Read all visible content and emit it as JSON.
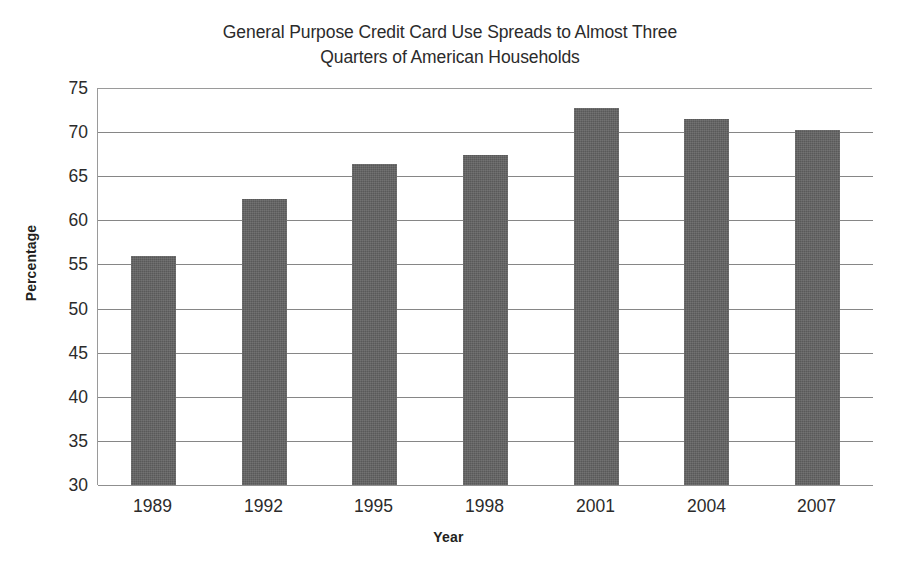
{
  "chart_data": {
    "type": "bar",
    "title": "General Purpose Credit Card Use Spreads to Almost Three\nQuarters of American Households",
    "title_line1": "General Purpose Credit Card Use Spreads to Almost Three",
    "title_line2": "Quarters of American Households",
    "xlabel": "Year",
    "ylabel": "Percentage",
    "categories": [
      "1989",
      "1992",
      "1995",
      "1998",
      "2001",
      "2004",
      "2007"
    ],
    "values": [
      56.0,
      62.4,
      66.4,
      67.4,
      72.7,
      71.5,
      70.2
    ],
    "series": [
      {
        "name": "Percentage of American households using general purpose credit cards",
        "values": [
          56.0,
          62.4,
          66.4,
          67.4,
          72.7,
          71.5,
          70.2
        ]
      }
    ],
    "ylim": [
      30,
      75
    ],
    "yticks": [
      30,
      35,
      40,
      45,
      50,
      55,
      60,
      65,
      70,
      75
    ],
    "ytick_labels": [
      "30",
      "35",
      "40",
      "45",
      "50",
      "55",
      "60",
      "65",
      "70",
      "75"
    ],
    "grid": true,
    "grid_axis": "y",
    "legend": false,
    "legend_position": "none",
    "bar_color": "#595959",
    "grid_color": "#868686",
    "background_color": "#ffffff",
    "text_color": "#2b2b2b"
  }
}
